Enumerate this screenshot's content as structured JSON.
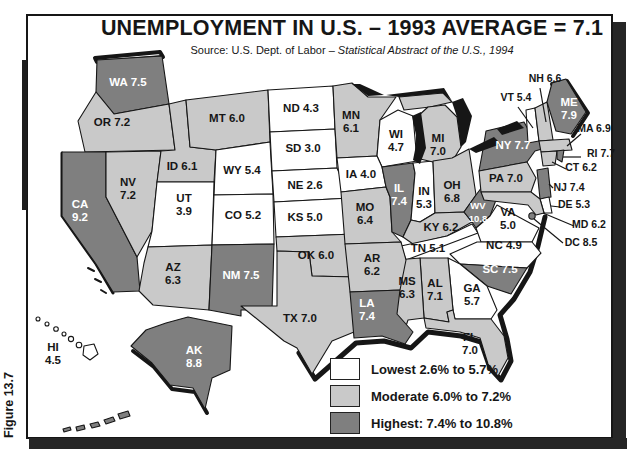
{
  "figure_label": "Figure 13.7",
  "title": "UNEMPLOYMENT IN U.S. – 1993 AVERAGE = 7.1",
  "source_prefix": "Source: U.S. Dept. of Labor – ",
  "source_italic": "Statistical Abstract of the U.S., 1994",
  "national_average": "7.1",
  "legend": {
    "items": [
      {
        "label": "Lowest 2.6% to 5.7%",
        "category": "lowest"
      },
      {
        "label": "Moderate 6.0% to 7.2%",
        "category": "moderate"
      },
      {
        "label": "Highest: 7.4% to 10.8%",
        "category": "highest"
      }
    ]
  },
  "map": {
    "colors": {
      "lowest": "#ffffff",
      "moderate": "#c9c9c9",
      "highest": "#7f7f7f",
      "water": "#161616"
    },
    "states": [
      {
        "id": "WA",
        "label": "WA 7.5",
        "value": 7.5,
        "category": "highest"
      },
      {
        "id": "OR",
        "label": "OR 7.2",
        "value": 7.2,
        "category": "moderate"
      },
      {
        "id": "CA",
        "label": "CA\n9.2",
        "value": 9.2,
        "category": "highest"
      },
      {
        "id": "NV",
        "label": "NV\n7.2",
        "value": 7.2,
        "category": "moderate"
      },
      {
        "id": "ID",
        "label": "ID 6.1",
        "value": 6.1,
        "category": "moderate"
      },
      {
        "id": "MT",
        "label": "MT 6.0",
        "value": 6.0,
        "category": "moderate"
      },
      {
        "id": "WY",
        "label": "WY 5.4",
        "value": 5.4,
        "category": "lowest"
      },
      {
        "id": "UT",
        "label": "UT\n3.9",
        "value": 3.9,
        "category": "lowest"
      },
      {
        "id": "CO",
        "label": "CO 5.2",
        "value": 5.2,
        "category": "lowest"
      },
      {
        "id": "AZ",
        "label": "AZ\n6.3",
        "value": 6.3,
        "category": "moderate"
      },
      {
        "id": "NM",
        "label": "NM 7.5",
        "value": 7.5,
        "category": "highest"
      },
      {
        "id": "ND",
        "label": "ND 4.3",
        "value": 4.3,
        "category": "lowest"
      },
      {
        "id": "SD",
        "label": "SD 3.0",
        "value": 3.0,
        "category": "lowest"
      },
      {
        "id": "NE",
        "label": "NE 2.6",
        "value": 2.6,
        "category": "lowest"
      },
      {
        "id": "KS",
        "label": "KS 5.0",
        "value": 5.0,
        "category": "lowest"
      },
      {
        "id": "OK",
        "label": "OK 6.0",
        "value": 6.0,
        "category": "moderate"
      },
      {
        "id": "TX",
        "label": "TX 7.0",
        "value": 7.0,
        "category": "moderate"
      },
      {
        "id": "MN",
        "label": "MN\n6.1",
        "value": 6.1,
        "category": "moderate"
      },
      {
        "id": "WI",
        "label": "WI\n4.7",
        "value": 4.7,
        "category": "lowest"
      },
      {
        "id": "IA",
        "label": "IA 4.0",
        "value": 4.0,
        "category": "lowest"
      },
      {
        "id": "MO",
        "label": "MO\n6.4",
        "value": 6.4,
        "category": "moderate"
      },
      {
        "id": "IL",
        "label": "IL\n7.4",
        "value": 7.4,
        "category": "highest"
      },
      {
        "id": "IN",
        "label": "IN\n5.3",
        "value": 5.3,
        "category": "lowest"
      },
      {
        "id": "MI",
        "label": "MI\n7.0",
        "value": 7.0,
        "category": "moderate"
      },
      {
        "id": "OH",
        "label": "OH\n6.8",
        "value": 6.8,
        "category": "moderate"
      },
      {
        "id": "KY",
        "label": "KY 6.2",
        "value": 6.2,
        "category": "moderate"
      },
      {
        "id": "TN",
        "label": "TN 5.1",
        "value": 5.1,
        "category": "lowest"
      },
      {
        "id": "WV",
        "label": "WV\n10.8",
        "value": 10.8,
        "category": "highest"
      },
      {
        "id": "VA",
        "label": "VA\n5.0",
        "value": 5.0,
        "category": "lowest"
      },
      {
        "id": "NC",
        "label": "NC 4.9",
        "value": 4.9,
        "category": "lowest"
      },
      {
        "id": "SC",
        "label": "SC 7.5",
        "value": 7.5,
        "category": "highest"
      },
      {
        "id": "GA",
        "label": "GA\n5.7",
        "value": 5.7,
        "category": "lowest"
      },
      {
        "id": "AL",
        "label": "AL\n7.1",
        "value": 7.1,
        "category": "moderate"
      },
      {
        "id": "MS",
        "label": "MS\n6.3",
        "value": 6.3,
        "category": "moderate"
      },
      {
        "id": "AR",
        "label": "AR\n6.2",
        "value": 6.2,
        "category": "moderate"
      },
      {
        "id": "LA",
        "label": "LA\n7.4",
        "value": 7.4,
        "category": "highest"
      },
      {
        "id": "FL",
        "label": "FL\n7.0",
        "value": 7.0,
        "category": "moderate"
      },
      {
        "id": "NY",
        "label": "NY 7.7",
        "value": 7.7,
        "category": "highest"
      },
      {
        "id": "PA",
        "label": "PA 7.0",
        "value": 7.0,
        "category": "moderate"
      },
      {
        "id": "ME",
        "label": "ME\n7.9",
        "value": 7.9,
        "category": "highest"
      },
      {
        "id": "VT",
        "label": "VT 5.4",
        "value": 5.4,
        "category": "lowest"
      },
      {
        "id": "NH",
        "label": "NH 6.6",
        "value": 6.6,
        "category": "moderate"
      },
      {
        "id": "MA",
        "label": "MA 6.9",
        "value": 6.9,
        "category": "moderate"
      },
      {
        "id": "RI",
        "label": "RI 7.7",
        "value": 7.7,
        "category": "highest"
      },
      {
        "id": "CT",
        "label": "CT 6.2",
        "value": 6.2,
        "category": "moderate"
      },
      {
        "id": "NJ",
        "label": "NJ 7.4",
        "value": 7.4,
        "category": "highest"
      },
      {
        "id": "DE",
        "label": "DE 5.3",
        "value": 5.3,
        "category": "lowest"
      },
      {
        "id": "MD",
        "label": "MD 6.2",
        "value": 6.2,
        "category": "moderate"
      },
      {
        "id": "DC",
        "label": "DC 8.5",
        "value": 8.5,
        "category": "highest"
      },
      {
        "id": "AK",
        "label": "AK\n8.8",
        "value": 8.8,
        "category": "highest"
      },
      {
        "id": "HI",
        "label": "HI\n4.5",
        "value": 4.5,
        "category": "lowest"
      }
    ]
  }
}
